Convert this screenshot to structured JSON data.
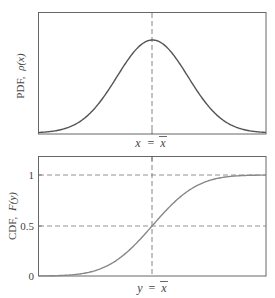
{
  "chart_data": [
    {
      "type": "line",
      "title": "",
      "ylabel": "PDF,  ρ(x)",
      "xlabel": "x = x̄",
      "xtick_center_label": "x = x̄",
      "description": "Gaussian probability density function centered at mean",
      "series": [
        {
          "name": "PDF",
          "function": "normal_pdf",
          "mean": 0,
          "std": 1
        }
      ],
      "x_range": [
        -3.2,
        3.2
      ],
      "grid": false,
      "vertical_dashed_line_at": "mean",
      "curve_color": "#555555"
    },
    {
      "type": "line",
      "title": "",
      "ylabel": "CDF,  F(y)",
      "xlabel": "y = x̄",
      "xtick_center_label": "y = x̄",
      "yticks": [
        0,
        0.5,
        1
      ],
      "ytick_labels": [
        "0",
        "0.5",
        "1"
      ],
      "ylim": [
        0,
        1.25
      ],
      "description": "Gaussian cumulative distribution function",
      "series": [
        {
          "name": "CDF",
          "function": "normal_cdf",
          "mean": 0,
          "std": 1
        }
      ],
      "x_range": [
        -3.2,
        3.2
      ],
      "horizontal_dashed_lines_at": [
        0.5,
        1
      ],
      "vertical_dashed_line_at": "mean",
      "curve_color": "#888888"
    }
  ],
  "pdf": {
    "ylabel_text": "PDF,",
    "ylabel_func": "ρ(x)",
    "xlabel_var": "x",
    "xlabel_eq": "=",
    "xlabel_mean": "x"
  },
  "cdf": {
    "ylabel_text": "CDF,",
    "ylabel_func": "F(y)",
    "xlabel_var": "y",
    "xlabel_eq": "=",
    "xlabel_mean": "x",
    "ytick_0": "0",
    "ytick_05": "0.5",
    "ytick_1": "1"
  }
}
